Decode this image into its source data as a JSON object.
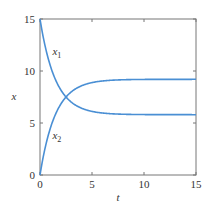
{
  "chart_data": {
    "type": "line",
    "title": "",
    "xlabel": "t",
    "ylabel": "x",
    "xlim": [
      0,
      15
    ],
    "ylim": [
      0,
      15
    ],
    "xticks": [
      0,
      5,
      10,
      15
    ],
    "yticks": [
      0,
      5,
      10,
      15
    ],
    "xtick_labels": [
      "0",
      "5",
      "10",
      "15"
    ],
    "ytick_labels": [
      "0",
      "5",
      "10",
      "15"
    ],
    "grid": false,
    "legend": "none (inline curve labels)",
    "series": [
      {
        "name": "x1",
        "label_main": "x",
        "label_sub": "1",
        "color": "#4a8fd4",
        "x": [
          0,
          0.5,
          1,
          1.5,
          2,
          2.5,
          3,
          4,
          5,
          6,
          8,
          10,
          12,
          15
        ],
        "y": [
          15.0,
          10.4,
          8.3,
          7.2,
          6.6,
          6.3,
          6.1,
          5.9,
          5.84,
          5.81,
          5.8,
          5.8,
          5.8,
          5.8
        ]
      },
      {
        "name": "x2",
        "label_main": "x",
        "label_sub": "2",
        "color": "#4a8fd4",
        "x": [
          0,
          0.5,
          1,
          1.5,
          2,
          2.5,
          3,
          4,
          5,
          6,
          8,
          10,
          12,
          15
        ],
        "y": [
          0.0,
          4.6,
          6.7,
          7.8,
          8.4,
          8.7,
          8.9,
          9.1,
          9.16,
          9.19,
          9.2,
          9.2,
          9.2,
          9.2
        ]
      }
    ],
    "annotations": [
      {
        "text": "x1",
        "at": [
          1.2,
          11.5
        ]
      },
      {
        "text": "x2",
        "at": [
          1.2,
          3.5
        ]
      }
    ],
    "model": "x1 = 5.8 + 9.2*exp(-0.675 t), x2 = 9.2*(1 - exp(-0.675 t)); x1 + x2 = 15"
  }
}
